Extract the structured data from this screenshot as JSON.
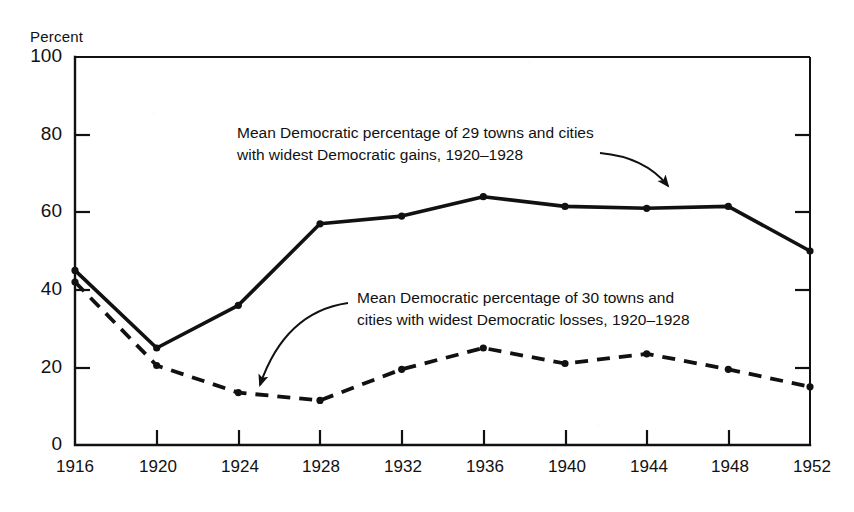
{
  "chart_data": {
    "type": "line",
    "title": "",
    "xlabel": "",
    "ylabel": "Percent",
    "categories": [
      "1916",
      "1920",
      "1924",
      "1928",
      "1932",
      "1936",
      "1940",
      "1944",
      "1948",
      "1952"
    ],
    "x": [
      1916,
      1920,
      1924,
      1928,
      1932,
      1936,
      1940,
      1944,
      1948,
      1952
    ],
    "xlim": [
      1916,
      1952
    ],
    "ylim": [
      0,
      100
    ],
    "y_ticks": [
      0,
      20,
      40,
      60,
      80,
      100
    ],
    "x_ticks": [
      1916,
      1920,
      1924,
      1928,
      1932,
      1936,
      1940,
      1944,
      1948,
      1952
    ],
    "grid": false,
    "legend_position": "inline-annotations",
    "series": [
      {
        "name": "Mean Democratic percentage of 29 towns and cities with widest Democratic gains, 1920–1928",
        "style": "solid",
        "values": [
          45,
          25,
          36,
          57,
          59,
          64,
          61.5,
          61,
          61.5,
          50
        ]
      },
      {
        "name": "Mean Democratic percentage of 30 towns and cities with widest Democratic losses, 1920–1928",
        "style": "dashed",
        "values": [
          42,
          20.5,
          13.5,
          11.5,
          19.5,
          25,
          21,
          23.5,
          19.5,
          15
        ]
      }
    ],
    "annotations": [
      {
        "id": "gains-label",
        "line1": "Mean Democratic percentage of 29 towns and cities",
        "line2": "with widest Democratic gains, 1920–1928",
        "arrow_to_series": "solid"
      },
      {
        "id": "losses-label",
        "line1": "Mean Democratic percentage of 30 towns and",
        "line2": "cities with widest Democratic losses, 1920–1928",
        "arrow_to_series": "dashed"
      }
    ],
    "colors": {
      "ink": "#111111",
      "background": "#ffffff"
    }
  },
  "axis": {
    "y_title": "Percent",
    "y_ticks": [
      "100",
      "80",
      "60",
      "40",
      "20",
      "0"
    ],
    "x_ticks": [
      "1916",
      "1920",
      "1924",
      "1928",
      "1932",
      "1936",
      "1940",
      "1944",
      "1948",
      "1952"
    ]
  },
  "annotations": {
    "gains": {
      "line1": "Mean Democratic percentage of 29 towns and cities",
      "line2": "with widest Democratic gains, 1920–1928"
    },
    "losses": {
      "line1": "Mean Democratic percentage of 30 towns and",
      "line2": "cities with widest Democratic losses, 1920–1928"
    }
  }
}
